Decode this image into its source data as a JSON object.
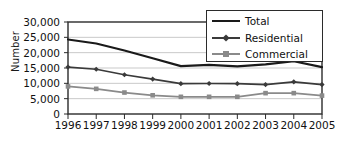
{
  "chart_data": {
    "type": "line",
    "title": "",
    "xlabel": "",
    "ylabel": "Number",
    "x": [
      "1996",
      "1997",
      "1998",
      "1999",
      "2000",
      "2001",
      "2002",
      "2003",
      "2004",
      "2005"
    ],
    "ylim": [
      0,
      30000
    ],
    "yticks": [
      0,
      5000,
      10000,
      15000,
      20000,
      25000,
      30000
    ],
    "ytick_labels": [
      "0",
      "5,000",
      "10,000",
      "15,000",
      "20,000",
      "25,000",
      "30,000"
    ],
    "grid": true,
    "legend_position": "top-right",
    "series": [
      {
        "name": "Total",
        "color": "#1a1a1a",
        "marker": "none",
        "values": [
          24300,
          23000,
          20700,
          18200,
          15600,
          16000,
          15500,
          16200,
          17200,
          15300
        ]
      },
      {
        "name": "Residential",
        "color": "#3a3a3a",
        "marker": "diamond",
        "values": [
          15300,
          14600,
          12800,
          11400,
          9900,
          9950,
          9900,
          9600,
          10500,
          9600
        ]
      },
      {
        "name": "Commercial",
        "color": "#8a8a8a",
        "marker": "square",
        "values": [
          9000,
          8200,
          7000,
          6100,
          5600,
          5600,
          5600,
          6800,
          6800,
          6000
        ]
      }
    ]
  },
  "axis": {
    "y_title": "Number"
  },
  "legend": {
    "items": [
      {
        "label": "Total"
      },
      {
        "label": "Residential"
      },
      {
        "label": "Commercial"
      }
    ]
  },
  "colors": {
    "total": "#1a1a1a",
    "residential": "#3a3a3a",
    "commercial": "#8a8a8a",
    "grid": "#c9c9c9",
    "axis": "#2b2b2b"
  }
}
